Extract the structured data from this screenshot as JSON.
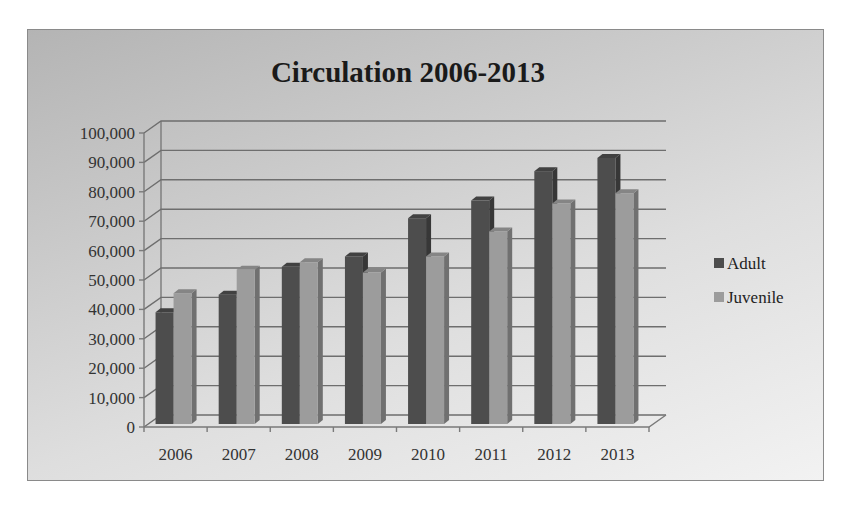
{
  "chart_data": {
    "type": "bar",
    "style": "3d-clustered-column",
    "title": "Circulation 2006-2013",
    "xlabel": "",
    "ylabel": "",
    "categories": [
      "2006",
      "2007",
      "2008",
      "2009",
      "2010",
      "2011",
      "2012",
      "2013"
    ],
    "series": [
      {
        "name": "Adult",
        "color": "#4d4d4d",
        "values": [
          38000,
          44000,
          53500,
          57000,
          70000,
          76000,
          86000,
          90500
        ]
      },
      {
        "name": "Juvenile",
        "color": "#9c9c9c",
        "values": [
          44500,
          52500,
          55000,
          51500,
          57000,
          65500,
          75000,
          78500
        ]
      }
    ],
    "ylim": [
      0,
      100000
    ],
    "y_ticks": [
      0,
      10000,
      20000,
      30000,
      40000,
      50000,
      60000,
      70000,
      80000,
      90000,
      100000
    ],
    "y_tick_labels": [
      "0",
      "10,000",
      "20,000",
      "30,000",
      "40,000",
      "50,000",
      "60,000",
      "70,000",
      "80,000",
      "90,000",
      "100,000"
    ],
    "grid": true,
    "legend_position": "right"
  }
}
